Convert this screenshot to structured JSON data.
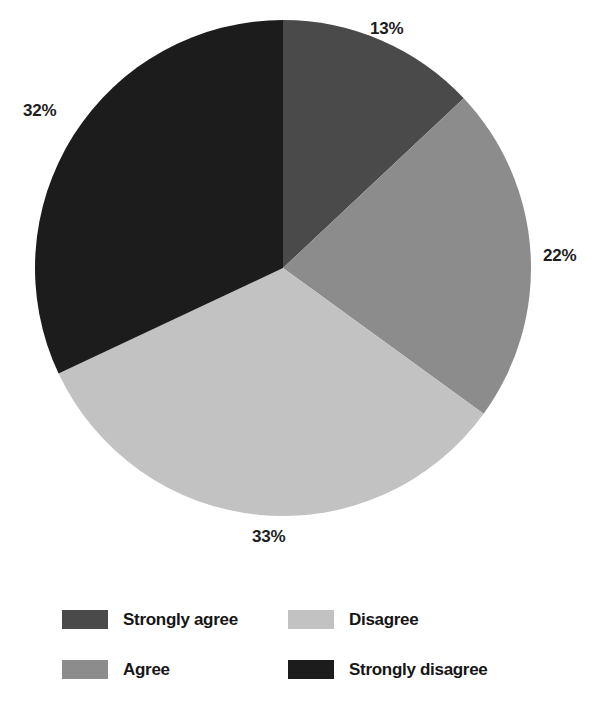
{
  "chart_data": {
    "type": "pie",
    "title": "",
    "subtitle": "",
    "xlabel": "",
    "ylabel": "",
    "grid": false,
    "legend_position": "bottom",
    "legend_columns": 2,
    "start_angle_deg": 0,
    "direction": "clockwise",
    "categories": [
      "Strongly agree",
      "Agree",
      "Disagree",
      "Strongly disagree"
    ],
    "values": [
      13,
      22,
      33,
      32
    ],
    "value_unit": "%",
    "data_labels": [
      "13%",
      "22%",
      "33%",
      "32%"
    ],
    "colors": [
      "#4a4a4a",
      "#8c8c8c",
      "#c2c2c2",
      "#1c1c1c"
    ],
    "slices": [
      {
        "label": "Strongly agree",
        "value": 13,
        "data_label": "13%",
        "color": "#4a4a4a"
      },
      {
        "label": "Agree",
        "value": 22,
        "data_label": "22%",
        "color": "#8c8c8c"
      },
      {
        "label": "Disagree",
        "value": 33,
        "data_label": "33%",
        "color": "#c2c2c2"
      },
      {
        "label": "Strongly disagree",
        "value": 32,
        "data_label": "32%",
        "color": "#1c1c1c"
      }
    ],
    "legend_entries": [
      {
        "label": "Strongly agree",
        "color": "#4a4a4a"
      },
      {
        "label": "Disagree",
        "color": "#c2c2c2"
      },
      {
        "label": "Agree",
        "color": "#8c8c8c"
      },
      {
        "label": "Strongly disagree",
        "color": "#1c1c1c"
      }
    ]
  },
  "geometry": {
    "center_x": 283,
    "center_y": 268,
    "radius": 248
  },
  "background_color": "#ffffff",
  "text_color": "#1d1d1d"
}
